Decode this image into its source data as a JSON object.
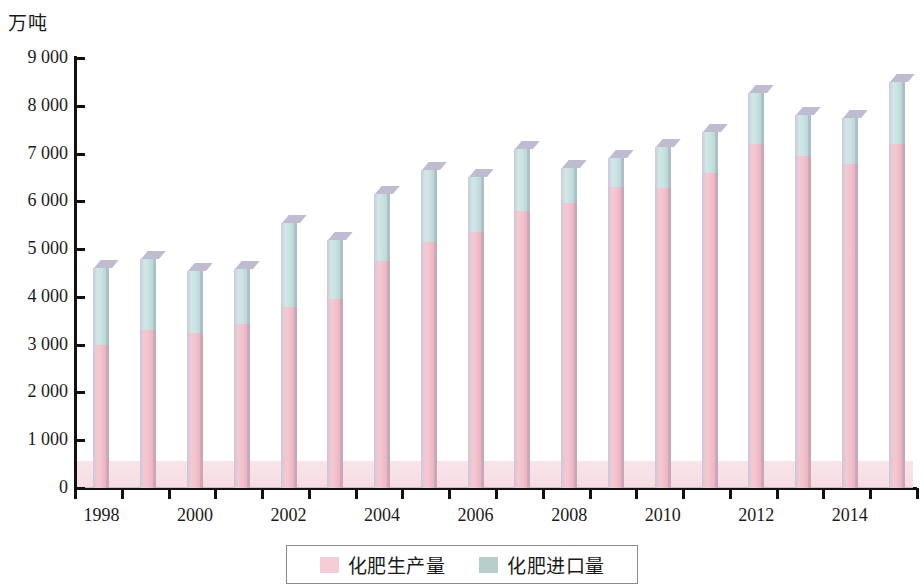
{
  "chart_data": {
    "type": "bar",
    "stacked": true,
    "title": "",
    "subtitle": "",
    "unit_label": "万吨",
    "xlabel": "",
    "ylabel": "万吨",
    "ylim": [
      0,
      9000
    ],
    "ytick_step": 1000,
    "grid": false,
    "legend_position": "bottom",
    "x": [
      1998,
      1999,
      2000,
      2001,
      2002,
      2003,
      2004,
      2005,
      2006,
      2007,
      2008,
      2009,
      2010,
      2011,
      2012,
      2013,
      2014,
      2015
    ],
    "categories": [
      "1998",
      "1999",
      "2000",
      "2001",
      "2002",
      "2003",
      "2004",
      "2005",
      "2006",
      "2007",
      "2008",
      "2009",
      "2010",
      "2011",
      "2012",
      "2013",
      "2014",
      "2015"
    ],
    "xtick_labels": [
      "1998",
      "",
      "2000",
      "",
      "2002",
      "",
      "2004",
      "",
      "2006",
      "",
      "2008",
      "",
      "2010",
      "",
      "2012",
      "",
      "2014",
      ""
    ],
    "ytick_labels": [
      "0",
      "1 000",
      "2 000",
      "3 000",
      "4 000",
      "5 000",
      "6 000",
      "7 000",
      "8 000",
      "9 000"
    ],
    "ytick_values": [
      0,
      1000,
      2000,
      3000,
      4000,
      5000,
      6000,
      7000,
      8000,
      9000
    ],
    "series": [
      {
        "name": "化肥生产量",
        "color": "#f4c3cd",
        "values": [
          3000,
          3300,
          3250,
          3430,
          3780,
          3950,
          4750,
          5150,
          5350,
          5800,
          5960,
          6300,
          6270,
          6600,
          7210,
          6950,
          6780,
          7210
        ]
      },
      {
        "name": "化肥进口量",
        "color": "#c9e4e2",
        "values": [
          1600,
          1500,
          1300,
          1150,
          1770,
          1250,
          1400,
          1500,
          1150,
          1300,
          740,
          600,
          860,
          850,
          1050,
          850,
          970,
          1280
        ]
      }
    ],
    "totals": [
      4600,
      4800,
      4550,
      4580,
      5550,
      5200,
      6150,
      6650,
      6500,
      7100,
      6700,
      6900,
      7130,
      7450,
      8260,
      7800,
      7750,
      8490
    ],
    "annotations": []
  },
  "legend": {
    "items": [
      {
        "label": "化肥生产量",
        "swatch": "legend-swatch-pink"
      },
      {
        "label": "化肥进口量",
        "swatch": "legend-swatch-teal"
      }
    ]
  },
  "colors": {
    "production": "#f4c3cd",
    "imports": "#c9e4e2",
    "axis": "#111111",
    "floor": "#f6e2e7",
    "legend_border": "#8b8b8b"
  }
}
